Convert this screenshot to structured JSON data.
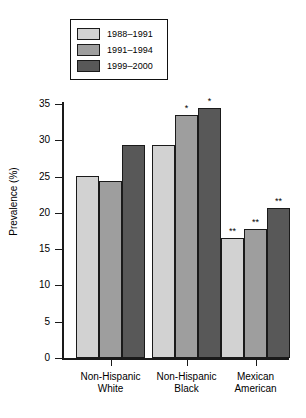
{
  "chart_data": {
    "type": "bar",
    "title": "",
    "xlabel": "",
    "ylabel": "Prevalence (%)",
    "ylim": [
      0,
      35
    ],
    "yticks": [
      0,
      5,
      10,
      15,
      20,
      25,
      30,
      35
    ],
    "ytick_labels": [
      "0",
      "5",
      "10",
      "15",
      "20",
      "25",
      "30",
      "35"
    ],
    "grid": false,
    "legend_position": "top-left",
    "categories": [
      "Non-Hispanic White",
      "Non-Hispanic Black",
      "Mexican American"
    ],
    "category_lines": [
      [
        "Non-Hispanic",
        "White"
      ],
      [
        "Non-Hispanic",
        "Black"
      ],
      [
        "Mexican",
        "American"
      ]
    ],
    "series": [
      {
        "name": "1988–1991",
        "color": "#d2d2d2",
        "values": [
          25.1,
          29.4,
          16.5
        ],
        "annotations": [
          "",
          "",
          "**"
        ]
      },
      {
        "name": "1991–1994",
        "color": "#9e9e9e",
        "values": [
          24.4,
          33.5,
          17.8
        ],
        "annotations": [
          "",
          "*",
          "**"
        ]
      },
      {
        "name": "1999–2000",
        "color": "#585858",
        "values": [
          29.3,
          34.4,
          20.7
        ],
        "annotations": [
          "",
          "*",
          "**"
        ]
      }
    ]
  },
  "legend": {
    "items": [
      {
        "label": "1988–1991",
        "color": "#d2d2d2"
      },
      {
        "label": "1991–1994",
        "color": "#9e9e9e"
      },
      {
        "label": "1999–2000",
        "color": "#585858"
      }
    ]
  },
  "axis": {
    "y_title": "Prevalence (%)",
    "ticks": [
      "35",
      "30",
      "25",
      "20",
      "15",
      "10",
      "5",
      "0"
    ]
  }
}
